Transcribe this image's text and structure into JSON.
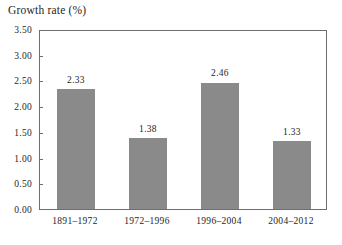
{
  "chart_data": {
    "type": "bar",
    "title": "Growth rate (%)",
    "xlabel": "",
    "ylabel": "",
    "categories": [
      "1891–1972",
      "1972–1996",
      "1996–2004",
      "2004–2012"
    ],
    "values": [
      2.33,
      1.38,
      2.46,
      1.33
    ],
    "value_labels": [
      "2.33",
      "1.38",
      "2.46",
      "1.33"
    ],
    "ylim": [
      0.0,
      3.5
    ],
    "ytick_values": [
      0.0,
      0.5,
      1.0,
      1.5,
      2.0,
      2.5,
      3.0,
      3.5
    ],
    "ytick_labels": [
      "0.00",
      "0.50",
      "1.00",
      "1.50",
      "2.00",
      "2.50",
      "3.00",
      "3.50"
    ],
    "grid": false,
    "legend": null,
    "bar_color": "#8a8a8a",
    "frame_color": "#6e6e6e",
    "background": "#ffffff"
  }
}
